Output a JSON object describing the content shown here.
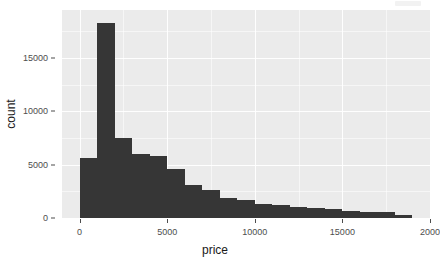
{
  "chart_data": {
    "type": "bar",
    "title": "",
    "subtitle": "",
    "xlabel": "price",
    "ylabel": "count",
    "grid": true,
    "legend": null,
    "xlim": [
      -1000,
      20000
    ],
    "ylim": [
      0,
      19500
    ],
    "x_ticks": [
      {
        "value": 0,
        "label": "0"
      },
      {
        "value": 5000,
        "label": "5000"
      },
      {
        "value": 10000,
        "label": "10000"
      },
      {
        "value": 15000,
        "label": "15000"
      },
      {
        "value": 20000,
        "label": "2000"
      }
    ],
    "y_ticks": [
      {
        "value": 0,
        "label": "0"
      },
      {
        "value": 5000,
        "label": "5000"
      },
      {
        "value": 10000,
        "label": "10000"
      },
      {
        "value": 15000,
        "label": "15000"
      }
    ],
    "bin_width": 1000,
    "bar_color": "#363636",
    "panel_color": "#ebebeb",
    "grid_color": "#ffffff",
    "categories": [
      "-500",
      "500",
      "1500",
      "2500",
      "3500",
      "4500",
      "5500",
      "6500",
      "7500",
      "8500",
      "9500",
      "10500",
      "11500",
      "12500",
      "13500",
      "14500",
      "15500",
      "16500",
      "17500",
      "18500"
    ],
    "bins": [
      {
        "center": -500,
        "x0": -1000,
        "x1": 0,
        "count": 0
      },
      {
        "center": 500,
        "x0": 0,
        "x1": 1000,
        "count": 5600
      },
      {
        "center": 1500,
        "x0": 1000,
        "x1": 2000,
        "count": 18250
      },
      {
        "center": 2500,
        "x0": 2000,
        "x1": 3000,
        "count": 7500
      },
      {
        "center": 3500,
        "x0": 3000,
        "x1": 4000,
        "count": 6000
      },
      {
        "center": 4500,
        "x0": 4000,
        "x1": 5000,
        "count": 5800
      },
      {
        "center": 5500,
        "x0": 5000,
        "x1": 6000,
        "count": 4600
      },
      {
        "center": 6500,
        "x0": 6000,
        "x1": 7000,
        "count": 3100
      },
      {
        "center": 7500,
        "x0": 7000,
        "x1": 8000,
        "count": 2600
      },
      {
        "center": 8500,
        "x0": 8000,
        "x1": 9000,
        "count": 1900
      },
      {
        "center": 9500,
        "x0": 9000,
        "x1": 10000,
        "count": 1700
      },
      {
        "center": 10500,
        "x0": 10000,
        "x1": 11000,
        "count": 1300
      },
      {
        "center": 11500,
        "x0": 11000,
        "x1": 12000,
        "count": 1200
      },
      {
        "center": 12500,
        "x0": 12000,
        "x1": 13000,
        "count": 1000
      },
      {
        "center": 13500,
        "x0": 13000,
        "x1": 14000,
        "count": 900
      },
      {
        "center": 14500,
        "x0": 14000,
        "x1": 15000,
        "count": 800
      },
      {
        "center": 15500,
        "x0": 15000,
        "x1": 16000,
        "count": 700
      },
      {
        "center": 16500,
        "x0": 16000,
        "x1": 17000,
        "count": 600
      },
      {
        "center": 17500,
        "x0": 17000,
        "x1": 18000,
        "count": 550
      },
      {
        "center": 18500,
        "x0": 18000,
        "x1": 19000,
        "count": 300
      }
    ],
    "values": [
      0,
      5600,
      18250,
      7500,
      6000,
      5800,
      4600,
      3100,
      2600,
      1900,
      1700,
      1300,
      1200,
      1000,
      900,
      800,
      700,
      600,
      550,
      300
    ]
  }
}
